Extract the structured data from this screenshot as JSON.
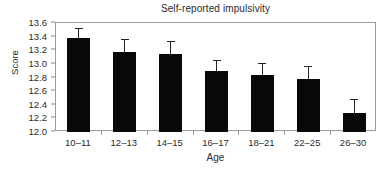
{
  "chart_data": {
    "type": "bar",
    "title": "Self-reported impulsivity",
    "xlabel": "Age",
    "ylabel": "Score",
    "categories": [
      "10–11",
      "12–13",
      "14–15",
      "16–17",
      "18–21",
      "22–25",
      "26–30"
    ],
    "values": [
      13.38,
      13.18,
      13.15,
      12.89,
      12.83,
      12.78,
      12.28
    ],
    "errors_upper": [
      13.53,
      13.37,
      13.33,
      13.05,
      13.01,
      12.97,
      12.48
    ],
    "error_magnitudes": [
      0.15,
      0.19,
      0.18,
      0.16,
      0.18,
      0.19,
      0.2
    ],
    "ylim": [
      12.0,
      13.6
    ],
    "yticks": [
      12.0,
      12.2,
      12.4,
      12.6,
      12.8,
      13.0,
      13.2,
      13.4,
      13.6
    ],
    "ytick_labels": [
      "12.0",
      "12.2",
      "12.4",
      "12.6",
      "12.8",
      "13.0",
      "13.2",
      "13.4",
      "13.6"
    ],
    "grid": false,
    "legend": null,
    "bar_color": "#080808",
    "error_color": "#232323",
    "axis_color": "#9a9a9a",
    "background": "#ffffff"
  }
}
